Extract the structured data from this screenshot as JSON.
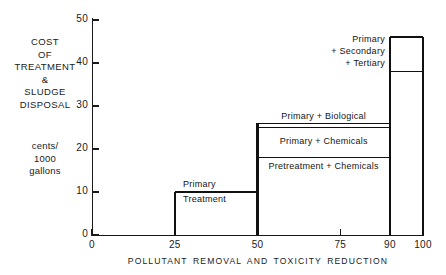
{
  "chart_data": {
    "type": "bar",
    "title": "",
    "subtitle": "",
    "xlabel": "POLLUTANT  REMOVAL  AND  TOXICITY  REDUCTION",
    "ylabel": "COST OF TREATMENT & SLUDGE DISPOSAL",
    "ylabel_units": "cents/1000 gallons",
    "xlim": [
      0,
      100
    ],
    "ylim": [
      0,
      50
    ],
    "grid": false,
    "legend": "none",
    "xticks": [
      0,
      25,
      50,
      75,
      90,
      100
    ],
    "xtick_labels": [
      "0",
      "25",
      "50",
      "75",
      "90",
      "100"
    ],
    "yticks": [
      0,
      10,
      20,
      30,
      40,
      50
    ],
    "ytick_labels": [
      "0",
      "10",
      "20",
      "30",
      "40",
      "50"
    ],
    "steps": [
      {
        "name": "primary-treatment",
        "x_start": 25,
        "x_end": 50,
        "top": 10,
        "label_above": "Primary",
        "label_below": "Treatment"
      },
      {
        "name": "primary-biological",
        "x_start": 50,
        "x_end": 90,
        "top": 26,
        "label": "Primary + Biological"
      },
      {
        "name": "primary-chemicals",
        "x_start": 50,
        "x_end": 90,
        "top": 25,
        "bottom": 18,
        "label": "Primary + Chemicals"
      },
      {
        "name": "pretreatment-chemicals",
        "x_start": 50,
        "x_end": 90,
        "top": 18,
        "bottom": 0,
        "label": "Pretreatment + Chemicals"
      },
      {
        "name": "primary-secondary-tertiary",
        "x_start": 90,
        "x_end": 100,
        "top": 46,
        "divider": 38,
        "label_lines": [
          "Primary",
          "+ Secondary",
          "+ Tertiary"
        ]
      }
    ],
    "colors": {
      "ink": "#111111",
      "background": "#ffffff"
    }
  },
  "ylabel_lines": [
    "COST",
    "OF",
    "TREATMENT",
    "&",
    "SLUDGE",
    "DISPOSAL"
  ],
  "yunit_lines": [
    "cents/",
    "1000",
    "gallons"
  ]
}
